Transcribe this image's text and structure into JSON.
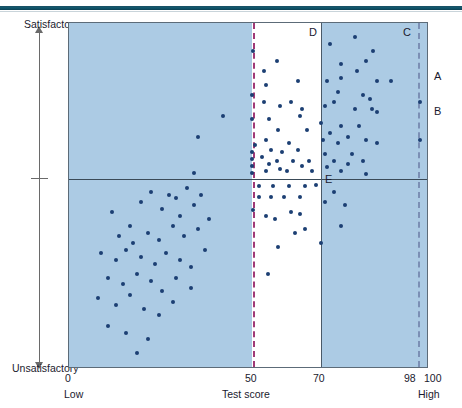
{
  "figure": {
    "title": "",
    "y_axis": {
      "label": "Job performance",
      "top_label": "Satisfactory",
      "bottom_label": "Unsatisfactory"
    },
    "x_axis": {
      "label": "Test score",
      "low_label": "Low",
      "high_label": "High",
      "ticks": [
        "0",
        "50",
        "70",
        "98",
        "100"
      ]
    },
    "annotations": {
      "quadrant_d": "D",
      "quadrant_c": "C",
      "point_e": "E",
      "point_a": "A",
      "point_b": "B"
    },
    "colors": {
      "shaded_region": "#accbe4",
      "point": "#1c3f73",
      "cutoff_line_50": "#a03a77",
      "cutoff_line_98": "#7b8fb5",
      "axis_line": "#4a5a68",
      "top_rule": "#11596e"
    }
  },
  "chart_data": {
    "type": "scatter",
    "title": "",
    "xlabel": "Test score",
    "ylabel": "Job performance",
    "xlim": [
      0,
      100
    ],
    "ylim": [
      0,
      100
    ],
    "grid": false,
    "legend": "none",
    "x_ticks": [
      0,
      50,
      70,
      98,
      100
    ],
    "x_tick_labels": [
      "0",
      "50",
      "70",
      "98",
      "100"
    ],
    "y_tick_labels": [
      "Unsatisfactory",
      "Satisfactory"
    ],
    "reference_lines": [
      {
        "name": "test-cutoff-50",
        "x": 50,
        "style": "dashed",
        "color": "#a03a77"
      },
      {
        "name": "test-cutoff-70",
        "x": 70,
        "style": "solid",
        "color": "#4a5a68"
      },
      {
        "name": "test-cutoff-98",
        "x": 98,
        "style": "dashed",
        "color": "#7b8fb5"
      },
      {
        "name": "performance-midline",
        "y": 55,
        "style": "solid",
        "color": "#3a4a57"
      }
    ],
    "shaded_regions": [
      {
        "name": "below-50",
        "x_from": 0,
        "x_to": 50,
        "color": "#accbe4"
      },
      {
        "name": "above-70",
        "x_from": 70,
        "x_to": 100,
        "color": "#accbe4"
      }
    ],
    "labeled_points": [
      {
        "label": "A",
        "x": 98,
        "y": 77
      },
      {
        "label": "B",
        "x": 98,
        "y": 66
      },
      {
        "label": "E",
        "x": 69,
        "y": 53
      }
    ],
    "points": [
      {
        "x": 43,
        "y": 73
      },
      {
        "x": 36,
        "y": 67
      },
      {
        "x": 35,
        "y": 56.5
      },
      {
        "x": 51.5,
        "y": 92
      },
      {
        "x": 51,
        "y": 79
      },
      {
        "x": 51,
        "y": 72
      },
      {
        "x": 52,
        "y": 64.5
      },
      {
        "x": 51,
        "y": 62.5
      },
      {
        "x": 51,
        "y": 60.5
      },
      {
        "x": 51,
        "y": 58.5
      },
      {
        "x": 51,
        "y": 56.5
      },
      {
        "x": 54.5,
        "y": 86
      },
      {
        "x": 55,
        "y": 82
      },
      {
        "x": 54.5,
        "y": 77
      },
      {
        "x": 56,
        "y": 72
      },
      {
        "x": 55,
        "y": 66
      },
      {
        "x": 56.5,
        "y": 63
      },
      {
        "x": 54,
        "y": 61
      },
      {
        "x": 56,
        "y": 59
      },
      {
        "x": 55,
        "y": 57
      },
      {
        "x": 58,
        "y": 89
      },
      {
        "x": 59,
        "y": 76
      },
      {
        "x": 58.5,
        "y": 69
      },
      {
        "x": 59.5,
        "y": 62.5
      },
      {
        "x": 58,
        "y": 60
      },
      {
        "x": 59,
        "y": 57.5
      },
      {
        "x": 62,
        "y": 77
      },
      {
        "x": 61.5,
        "y": 65
      },
      {
        "x": 62.5,
        "y": 60
      },
      {
        "x": 61,
        "y": 57
      },
      {
        "x": 64,
        "y": 83
      },
      {
        "x": 65,
        "y": 75
      },
      {
        "x": 64.5,
        "y": 73
      },
      {
        "x": 64,
        "y": 63
      },
      {
        "x": 65,
        "y": 58.5
      },
      {
        "x": 66.5,
        "y": 69
      },
      {
        "x": 67,
        "y": 60
      },
      {
        "x": 68,
        "y": 57
      },
      {
        "x": 53,
        "y": 52.5
      },
      {
        "x": 57,
        "y": 52.5
      },
      {
        "x": 61.5,
        "y": 52.5
      },
      {
        "x": 66,
        "y": 52.5
      },
      {
        "x": 53,
        "y": 49.5
      },
      {
        "x": 56.5,
        "y": 49.5
      },
      {
        "x": 60,
        "y": 49.5
      },
      {
        "x": 64.5,
        "y": 49.5
      },
      {
        "x": 51.5,
        "y": 45.5
      },
      {
        "x": 55,
        "y": 44
      },
      {
        "x": 57.5,
        "y": 43
      },
      {
        "x": 62,
        "y": 45
      },
      {
        "x": 64.5,
        "y": 44.5
      },
      {
        "x": 63,
        "y": 39
      },
      {
        "x": 66,
        "y": 40
      },
      {
        "x": 58.5,
        "y": 35
      },
      {
        "x": 55.5,
        "y": 27
      },
      {
        "x": 73,
        "y": 94
      },
      {
        "x": 76,
        "y": 88
      },
      {
        "x": 80,
        "y": 96
      },
      {
        "x": 83,
        "y": 89
      },
      {
        "x": 85,
        "y": 92
      },
      {
        "x": 80.5,
        "y": 86
      },
      {
        "x": 72,
        "y": 83
      },
      {
        "x": 76,
        "y": 84
      },
      {
        "x": 86,
        "y": 83
      },
      {
        "x": 90,
        "y": 83
      },
      {
        "x": 75,
        "y": 80
      },
      {
        "x": 82,
        "y": 79
      },
      {
        "x": 84,
        "y": 78
      },
      {
        "x": 71.5,
        "y": 76
      },
      {
        "x": 74,
        "y": 77
      },
      {
        "x": 80,
        "y": 75
      },
      {
        "x": 84.5,
        "y": 75
      },
      {
        "x": 86,
        "y": 74
      },
      {
        "x": 70.5,
        "y": 71
      },
      {
        "x": 76,
        "y": 70
      },
      {
        "x": 81,
        "y": 70
      },
      {
        "x": 73,
        "y": 68
      },
      {
        "x": 78,
        "y": 67
      },
      {
        "x": 71,
        "y": 66
      },
      {
        "x": 75,
        "y": 65
      },
      {
        "x": 83,
        "y": 66
      },
      {
        "x": 86,
        "y": 65
      },
      {
        "x": 71.5,
        "y": 62
      },
      {
        "x": 79,
        "y": 62
      },
      {
        "x": 74,
        "y": 60
      },
      {
        "x": 78,
        "y": 59
      },
      {
        "x": 82,
        "y": 60
      },
      {
        "x": 72,
        "y": 58
      },
      {
        "x": 76,
        "y": 57
      },
      {
        "x": 83,
        "y": 56
      },
      {
        "x": 74,
        "y": 51
      },
      {
        "x": 71.5,
        "y": 48
      },
      {
        "x": 77,
        "y": 47
      },
      {
        "x": 76,
        "y": 41
      },
      {
        "x": 70.5,
        "y": 36
      },
      {
        "x": 12,
        "y": 45
      },
      {
        "x": 17,
        "y": 41
      },
      {
        "x": 20,
        "y": 48
      },
      {
        "x": 23,
        "y": 51
      },
      {
        "x": 26,
        "y": 46
      },
      {
        "x": 28,
        "y": 50
      },
      {
        "x": 30,
        "y": 49
      },
      {
        "x": 33,
        "y": 52
      },
      {
        "x": 31,
        "y": 44
      },
      {
        "x": 35,
        "y": 47
      },
      {
        "x": 37,
        "y": 50
      },
      {
        "x": 14,
        "y": 38
      },
      {
        "x": 18,
        "y": 36
      },
      {
        "x": 22,
        "y": 39
      },
      {
        "x": 25,
        "y": 37
      },
      {
        "x": 29,
        "y": 41
      },
      {
        "x": 32,
        "y": 38
      },
      {
        "x": 36,
        "y": 40
      },
      {
        "x": 39,
        "y": 43
      },
      {
        "x": 9,
        "y": 33
      },
      {
        "x": 13,
        "y": 31
      },
      {
        "x": 16,
        "y": 34
      },
      {
        "x": 20,
        "y": 32
      },
      {
        "x": 24,
        "y": 30
      },
      {
        "x": 27,
        "y": 33
      },
      {
        "x": 31,
        "y": 31
      },
      {
        "x": 34,
        "y": 29
      },
      {
        "x": 38,
        "y": 34
      },
      {
        "x": 11,
        "y": 26
      },
      {
        "x": 15,
        "y": 24
      },
      {
        "x": 19,
        "y": 27
      },
      {
        "x": 23,
        "y": 25
      },
      {
        "x": 26,
        "y": 22
      },
      {
        "x": 30,
        "y": 26
      },
      {
        "x": 34,
        "y": 23
      },
      {
        "x": 8,
        "y": 20
      },
      {
        "x": 13,
        "y": 18
      },
      {
        "x": 17,
        "y": 21
      },
      {
        "x": 21,
        "y": 17
      },
      {
        "x": 25,
        "y": 15
      },
      {
        "x": 29,
        "y": 19
      },
      {
        "x": 11,
        "y": 12
      },
      {
        "x": 16,
        "y": 10
      },
      {
        "x": 22,
        "y": 8
      },
      {
        "x": 19,
        "y": 4
      }
    ]
  }
}
